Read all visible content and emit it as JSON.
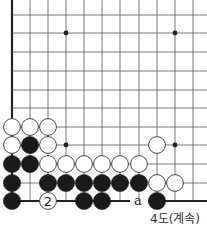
{
  "diagram": {
    "caption": "4도(계속)",
    "board": {
      "col_x": [
        12,
        30,
        48,
        66,
        84,
        102,
        120,
        139,
        157,
        175,
        193
      ],
      "row_y": [
        15,
        33,
        52,
        71,
        90,
        108,
        127,
        145,
        164,
        183,
        201
      ],
      "left_edge": true,
      "bottom_edge": true,
      "star_points": [
        [
          3,
          1
        ],
        [
          9,
          1
        ],
        [
          3,
          7
        ],
        [
          9,
          7
        ]
      ],
      "line_color": "#555555",
      "edge_color": "#222222"
    },
    "stones": [
      {
        "col": 0,
        "row": 6,
        "color": "white"
      },
      {
        "col": 1,
        "row": 6,
        "color": "white"
      },
      {
        "col": 2,
        "row": 6,
        "color": "white"
      },
      {
        "col": 0,
        "row": 7,
        "color": "white"
      },
      {
        "col": 1,
        "row": 7,
        "color": "black"
      },
      {
        "col": 2,
        "row": 7,
        "color": "white"
      },
      {
        "col": 8,
        "row": 7,
        "color": "white"
      },
      {
        "col": 0,
        "row": 8,
        "color": "black"
      },
      {
        "col": 1,
        "row": 8,
        "color": "black"
      },
      {
        "col": 2,
        "row": 8,
        "color": "white"
      },
      {
        "col": 3,
        "row": 8,
        "color": "white"
      },
      {
        "col": 4,
        "row": 8,
        "color": "white"
      },
      {
        "col": 5,
        "row": 8,
        "color": "white"
      },
      {
        "col": 6,
        "row": 8,
        "color": "white"
      },
      {
        "col": 7,
        "row": 8,
        "color": "white"
      },
      {
        "col": 0,
        "row": 9,
        "color": "black"
      },
      {
        "col": 2,
        "row": 9,
        "color": "black"
      },
      {
        "col": 3,
        "row": 9,
        "color": "black"
      },
      {
        "col": 4,
        "row": 9,
        "color": "black"
      },
      {
        "col": 5,
        "row": 9,
        "color": "black"
      },
      {
        "col": 6,
        "row": 9,
        "color": "black"
      },
      {
        "col": 7,
        "row": 9,
        "color": "black"
      },
      {
        "col": 8,
        "row": 9,
        "color": "white"
      },
      {
        "col": 9,
        "row": 9,
        "color": "white"
      },
      {
        "col": 0,
        "row": 10,
        "color": "black"
      },
      {
        "col": 2,
        "row": 10,
        "color": "white",
        "label": "2"
      },
      {
        "col": 4,
        "row": 10,
        "color": "black"
      },
      {
        "col": 5,
        "row": 10,
        "color": "black"
      },
      {
        "col": 8,
        "row": 10,
        "color": "black"
      }
    ],
    "markers": [
      {
        "col": 7,
        "row": 10,
        "label": "a"
      }
    ]
  }
}
